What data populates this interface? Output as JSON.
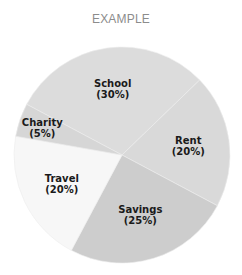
{
  "chart_data": {
    "type": "pie",
    "title": "EXAMPLE",
    "slices": [
      {
        "label": "School",
        "value": 30,
        "display": "(30%)",
        "color": "#dcdcdc"
      },
      {
        "label": "Rent",
        "value": 20,
        "display": "(20%)",
        "color": "#d9d9d9"
      },
      {
        "label": "Savings",
        "value": 25,
        "display": "(25%)",
        "color": "#cdcdcd"
      },
      {
        "label": "Travel",
        "value": 20,
        "display": "(20%)",
        "color": "#f7f7f7"
      },
      {
        "label": "Charity",
        "value": 5,
        "display": "(5%)",
        "color": "#d6d6d6"
      }
    ],
    "start_angle_deg": -62,
    "direction": "clockwise",
    "legend": "none"
  }
}
